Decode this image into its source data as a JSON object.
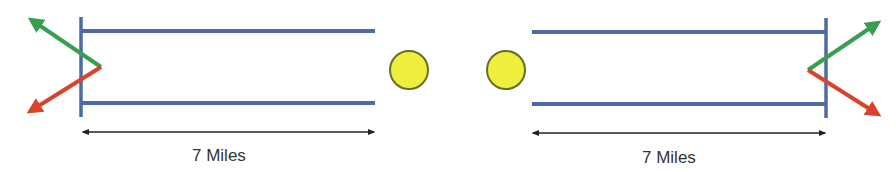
{
  "diagram": {
    "colors": {
      "track": "#4e6aa3",
      "green_arrow": "#3a9e4f",
      "red_arrow": "#d9432a",
      "ball_fill": "#eeee3c",
      "ball_stroke": "#6b6b2a",
      "dimension": "#222222",
      "text": "#333333"
    },
    "left_segment": {
      "label": "7 Miles",
      "ball": "yellow-circle"
    },
    "right_segment": {
      "label": "7 Miles",
      "ball": "yellow-circle"
    }
  }
}
